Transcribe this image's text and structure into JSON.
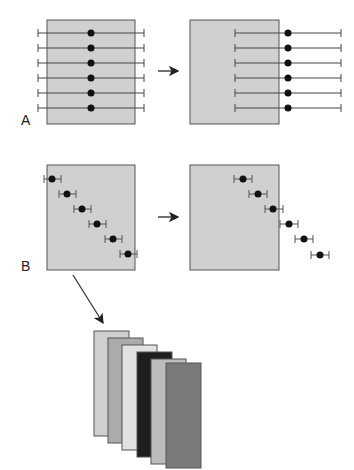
{
  "panels": {
    "A": {
      "label": "A"
    },
    "B": {
      "label": "B"
    }
  },
  "colors": {
    "panel_fill": "#d0d0d0",
    "panel_stroke": "#555555",
    "line": "#444444",
    "dot": "#111111"
  },
  "stack_colors": [
    "#cfcfcf",
    "#ababab",
    "#e2e2e2",
    "#1e1e1e",
    "#bcbcbc",
    "#7a7a7a"
  ]
}
